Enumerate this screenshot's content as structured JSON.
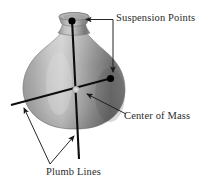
{
  "figure": {
    "name": "center-of-mass-plumb-line-diagram",
    "background_color": "#ffffff",
    "width": 213,
    "height": 183
  },
  "labels": {
    "suspension_points": "Suspension Points",
    "center_of_mass": "Center of Mass",
    "plumb_lines": "Plumb Lines"
  },
  "colors": {
    "text": "#2b2b2b",
    "line": "#111111",
    "leader": "#2b2b2b",
    "marker": "#000000",
    "vase_light": "#cfcfcf",
    "vase_mid": "#9a9a9a",
    "vase_dark": "#5f5f5f",
    "vase_edge": "#7d7d7d"
  },
  "object": {
    "name": "vase",
    "description": "shaded bulbous vase with narrow neck and flared lip"
  },
  "markers": [
    {
      "name": "suspension-point-top",
      "x": 72,
      "y": 21
    },
    {
      "name": "suspension-point-shoulder",
      "x": 110,
      "y": 78
    },
    {
      "name": "center-of-mass-point",
      "x": 76,
      "y": 89
    }
  ],
  "plumb_lines": [
    {
      "name": "vertical-plumb-line",
      "x1": 72,
      "y1": 20,
      "x2": 79,
      "y2": 159
    },
    {
      "name": "diagonal-plumb-line",
      "x1": 12,
      "y1": 104,
      "x2": 111,
      "y2": 78
    }
  ]
}
